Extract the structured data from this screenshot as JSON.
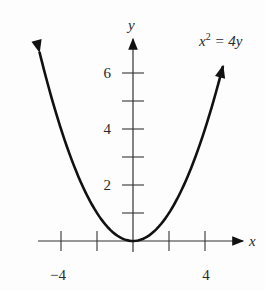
{
  "chart_data": {
    "type": "line",
    "title": "",
    "equation_label": "x² = 4y",
    "equation_base": "x",
    "equation_exp": "2",
    "equation_rest": " = 4y",
    "xlabel": "x",
    "ylabel": "y",
    "x_tick_labels": [
      {
        "value": -4,
        "label": "−4"
      },
      {
        "value": 4,
        "label": "4"
      }
    ],
    "y_tick_labels": [
      {
        "value": 6,
        "label": "6"
      },
      {
        "value": 4,
        "label": "4"
      },
      {
        "value": 2,
        "label": "2"
      }
    ],
    "x_ticks": [
      -4,
      -2,
      0,
      2,
      4
    ],
    "y_ticks": [
      1,
      2,
      3,
      4,
      5,
      6
    ],
    "xlim": [
      -5.3,
      6
    ],
    "ylim": [
      0,
      7
    ],
    "grid": false,
    "series": [
      {
        "name": "x^2 = 4y",
        "function": "y = x^2 / 4",
        "x": [
          -5.2,
          -4,
          -3,
          -2,
          -1,
          0,
          1,
          2,
          3,
          4,
          5.0
        ],
        "values": [
          6.76,
          4,
          2.25,
          1,
          0.25,
          0,
          0.25,
          1,
          2.25,
          4,
          6.25
        ],
        "arrows_at_ends": true
      }
    ],
    "colors": {
      "curve": "#111111",
      "axes": "#333333",
      "text": "#2a2a2a"
    }
  }
}
